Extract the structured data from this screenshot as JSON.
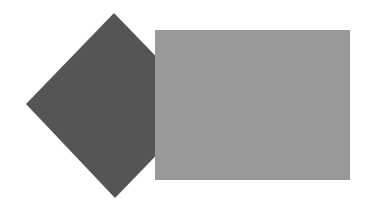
{
  "canvas": {
    "width": 369,
    "height": 212,
    "background": "#ffffff"
  },
  "shapes": [
    {
      "type": "diamond",
      "fill": "#555555",
      "points": [
        [
          114,
          13
        ],
        [
          204,
          106
        ],
        [
          115,
          198
        ],
        [
          26,
          104
        ]
      ]
    },
    {
      "type": "rectangle",
      "fill": "#999999",
      "x": 155,
      "y": 30,
      "width": 195,
      "height": 150
    }
  ]
}
